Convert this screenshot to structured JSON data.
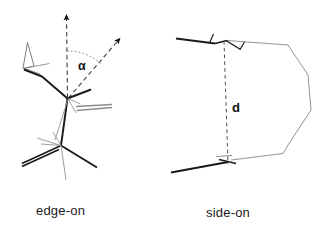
{
  "figure": {
    "background_color": "#ffffff",
    "panels": [
      {
        "id": "edge-on",
        "caption": "edge-on",
        "annotation_symbol": "α",
        "annotation_meaning": "tilt-angle",
        "description": "molecular skeleton viewed edge-on with dashed surface-normal arrow and dashed molecular-axis arrow subtending angle alpha"
      },
      {
        "id": "side-on",
        "caption": "side-on",
        "annotation_symbol": "d",
        "annotation_meaning": "interplane-distance",
        "description": "molecular ring viewed side-on between two bars separated by a dashed distance marker d"
      }
    ],
    "colors": {
      "bond_dark": "#1a1a1a",
      "bond_light": "#8c8c8c",
      "dashed": "#4d4d4d",
      "text": "#1a1a1a"
    }
  }
}
